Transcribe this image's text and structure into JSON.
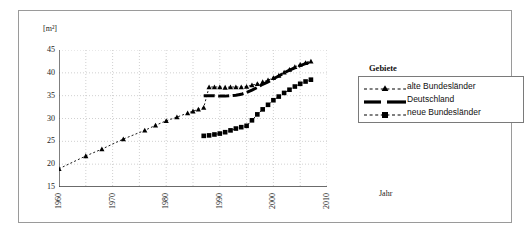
{
  "figure": {
    "unit_label": "[m²]",
    "xaxis_title": "Jahr"
  },
  "legend": {
    "title": "Gebiete",
    "entries": [
      {
        "label": "alte Bundesländer",
        "marker": "triangle-dashed-marker"
      },
      {
        "label": "Deutschland",
        "marker": "solid-line-marker"
      },
      {
        "label": "neue Bundesländer",
        "marker": "square-dashed-marker"
      }
    ]
  },
  "chart_data": {
    "type": "line",
    "title": "",
    "xlabel": "Jahr",
    "ylabel": "[m²]",
    "xlim": [
      1960,
      2010
    ],
    "ylim": [
      15,
      45
    ],
    "xticks": [
      1960,
      1965,
      1970,
      1975,
      1980,
      1985,
      1990,
      1995,
      2000,
      2005,
      2010
    ],
    "xtick_labels": [
      "1960",
      "",
      "1970",
      "",
      "1980",
      "",
      "1990",
      "",
      "2000",
      "",
      "2010"
    ],
    "yticks": [
      15,
      20,
      25,
      30,
      35,
      40,
      45
    ],
    "ytick_labels": [
      "15",
      "20",
      "25",
      "30",
      "35",
      "40",
      "45"
    ],
    "grid": true,
    "legend_position": "right",
    "series": [
      {
        "name": "alte Bundesländer",
        "color": "#000000",
        "style": "dashed",
        "marker": "triangle",
        "x": [
          1960,
          1965,
          1968,
          1972,
          1976,
          1978,
          1980,
          1982,
          1984,
          1985,
          1986,
          1987,
          1988,
          1989,
          1990,
          1991,
          1992,
          1993,
          1994,
          1995,
          1996,
          1997,
          1998,
          1999,
          2000,
          2001,
          2002,
          2003,
          2004,
          2005,
          2006,
          2007
        ],
        "y": [
          19.0,
          21.8,
          23.3,
          25.5,
          27.4,
          28.5,
          29.5,
          30.3,
          31.2,
          31.6,
          32.0,
          32.4,
          36.9,
          36.9,
          36.9,
          36.8,
          36.9,
          36.9,
          36.9,
          37.0,
          37.3,
          37.6,
          38.0,
          38.4,
          38.9,
          39.4,
          40.1,
          40.7,
          41.3,
          41.8,
          42.2,
          42.5
        ]
      },
      {
        "name": "Deutschland",
        "color": "#000000",
        "style": "solid-thick",
        "marker": "none",
        "x": [
          1987,
          1988,
          1989,
          1990,
          1991,
          1992,
          1993,
          1994,
          1995,
          1996,
          1997,
          1998,
          1999,
          2000,
          2001,
          2002,
          2003,
          2004,
          2005,
          2006,
          2007
        ],
        "y": [
          35.0,
          35.0,
          35.0,
          34.9,
          34.9,
          35.0,
          35.1,
          35.3,
          35.7,
          36.2,
          36.8,
          37.5,
          38.0,
          38.7,
          39.3,
          40.0,
          40.6,
          41.1,
          41.6,
          42.0,
          42.4
        ]
      },
      {
        "name": "neue Bundesländer",
        "color": "#000000",
        "style": "dashed",
        "marker": "square",
        "x": [
          1987,
          1988,
          1989,
          1990,
          1991,
          1992,
          1993,
          1994,
          1995,
          1996,
          1997,
          1998,
          1999,
          2000,
          2001,
          2002,
          2003,
          2004,
          2005,
          2006,
          2007
        ],
        "y": [
          26.2,
          26.3,
          26.5,
          26.7,
          27.0,
          27.4,
          27.8,
          28.1,
          28.4,
          29.6,
          30.9,
          32.0,
          33.0,
          34.0,
          34.8,
          35.6,
          36.3,
          37.0,
          37.6,
          38.1,
          38.5
        ]
      }
    ]
  }
}
